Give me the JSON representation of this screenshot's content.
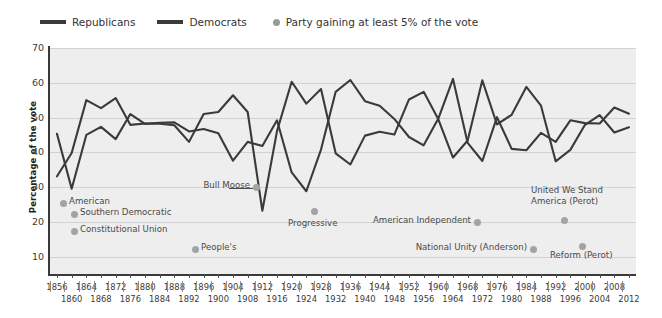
{
  "legend": {
    "items": [
      {
        "label": "Republicans",
        "marker": "line-swatch",
        "color": "#3a3a3a"
      },
      {
        "label": "Democrats",
        "marker": "line-swatch",
        "color": "#3a3a3a"
      },
      {
        "label": "Party gaining at least 5% of the vote",
        "marker": "dot",
        "color": "#9a9a9a"
      }
    ]
  },
  "axes": {
    "ylabel": "Percentage of the vote",
    "yticks": [
      70,
      60,
      50,
      40,
      30,
      20,
      10
    ],
    "ylim": [
      5,
      70
    ],
    "xticks": [
      1856,
      1860,
      1864,
      1868,
      1872,
      1876,
      1880,
      1884,
      1888,
      1892,
      1896,
      1900,
      1904,
      1908,
      1912,
      1916,
      1920,
      1924,
      1928,
      1932,
      1936,
      1940,
      1944,
      1948,
      1952,
      1956,
      1960,
      1964,
      1968,
      1972,
      1976,
      1980,
      1984,
      1988,
      1992,
      1996,
      2000,
      2004,
      2008,
      2012
    ],
    "xlim": [
      1856,
      2012
    ],
    "grid": "horizontal"
  },
  "annotations": [
    {
      "name": "american",
      "text": "American",
      "dot_year": 1856,
      "dot_value": 21.5,
      "label_side": "right"
    },
    {
      "name": "southern-democratic",
      "text": "Southern Democratic",
      "dot_year": 1860,
      "dot_value": 18.1,
      "label_side": "right"
    },
    {
      "name": "constitutional-union",
      "text": "Constitutional Union",
      "dot_year": 1860,
      "dot_value": 12.6,
      "label_side": "right"
    },
    {
      "name": "peoples",
      "text": "People's",
      "dot_year": 1892,
      "dot_value": 8.5,
      "label_side": "right"
    },
    {
      "name": "bull-moose",
      "text": "Bull Moose",
      "dot_year": 1912,
      "dot_value": 27.4,
      "label_side": "leader"
    },
    {
      "name": "progressive",
      "text": "Progressive",
      "dot_year": 1924,
      "dot_value": 16.6,
      "label_side": "below"
    },
    {
      "name": "american-independent",
      "text": "American Independent",
      "dot_year": 1968,
      "dot_value": 13.5,
      "label_side": "left"
    },
    {
      "name": "national-unity-anderson",
      "text": "National Unity (Anderson)",
      "dot_year": 1980,
      "dot_value": 6.6,
      "label_side": "left"
    },
    {
      "name": "united-we-stand-america-perot",
      "text": "United We Stand\nAmerica (Perot)",
      "dot_year": 1992,
      "dot_value": 18.9,
      "label_side": "above"
    },
    {
      "name": "reform-perot",
      "text": "Reform (Perot)",
      "dot_year": 1996,
      "dot_value": 8.4,
      "label_side": "below"
    }
  ],
  "chart_data": {
    "type": "line",
    "title": "",
    "xlabel": "",
    "ylabel": "Percentage of the vote",
    "ylim": [
      5,
      70
    ],
    "xlim": [
      1856,
      2012
    ],
    "grid": true,
    "legend_position": "top-left",
    "x": [
      1856,
      1860,
      1864,
      1868,
      1872,
      1876,
      1880,
      1884,
      1888,
      1892,
      1896,
      1900,
      1904,
      1908,
      1912,
      1916,
      1920,
      1924,
      1928,
      1932,
      1936,
      1940,
      1944,
      1948,
      1952,
      1956,
      1960,
      1964,
      1968,
      1972,
      1976,
      1980,
      1984,
      1988,
      1992,
      1996,
      2000,
      2004,
      2008,
      2012
    ],
    "series": [
      {
        "name": "Republicans",
        "color": "#3a3a3a",
        "values": [
          33.1,
          39.8,
          55.0,
          52.7,
          55.6,
          47.9,
          48.3,
          48.2,
          47.8,
          43.0,
          51.0,
          51.6,
          56.4,
          51.6,
          23.2,
          46.1,
          60.3,
          54.0,
          58.2,
          39.7,
          36.5,
          44.8,
          45.9,
          45.1,
          55.2,
          57.4,
          49.5,
          38.5,
          43.4,
          60.7,
          48.0,
          50.8,
          58.8,
          53.4,
          37.4,
          40.7,
          47.9,
          50.7,
          45.7,
          47.2
        ]
      },
      {
        "name": "Democrats",
        "color": "#3a3a3a",
        "values": [
          45.3,
          29.5,
          45.0,
          47.3,
          43.8,
          51.0,
          48.2,
          48.5,
          48.6,
          46.0,
          46.7,
          45.5,
          37.6,
          43.0,
          41.8,
          49.2,
          34.2,
          28.8,
          40.8,
          57.4,
          60.8,
          54.7,
          53.4,
          49.6,
          44.4,
          42.0,
          49.7,
          61.1,
          42.7,
          37.5,
          50.1,
          41.0,
          40.6,
          45.6,
          43.0,
          49.2,
          48.4,
          48.3,
          52.9,
          51.1
        ]
      }
    ],
    "third_party_markers": [
      {
        "year": 1856,
        "value": 21.5,
        "label": "American"
      },
      {
        "year": 1860,
        "value": 18.1,
        "label": "Southern Democratic"
      },
      {
        "year": 1860,
        "value": 12.6,
        "label": "Constitutional Union"
      },
      {
        "year": 1892,
        "value": 8.5,
        "label": "People's"
      },
      {
        "year": 1912,
        "value": 27.4,
        "label": "Bull Moose"
      },
      {
        "year": 1924,
        "value": 16.6,
        "label": "Progressive"
      },
      {
        "year": 1968,
        "value": 13.5,
        "label": "American Independent"
      },
      {
        "year": 1980,
        "value": 6.6,
        "label": "National Unity (Anderson)"
      },
      {
        "year": 1992,
        "value": 18.9,
        "label": "United We Stand America (Perot)"
      },
      {
        "year": 1996,
        "value": 8.4,
        "label": "Reform (Perot)"
      }
    ]
  }
}
